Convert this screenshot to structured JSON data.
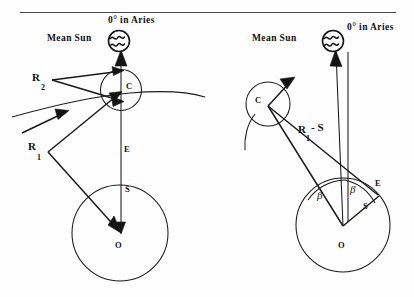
{
  "figure": {
    "title_rule": "horizontal-divider",
    "background_color": "#fefefe",
    "ink_color": "#141414"
  },
  "panels": [
    {
      "id": "left-panel",
      "name": "equation-of-centre-configuration-1",
      "labels": {
        "mean_sun": "Mean Sun",
        "aries": "0° in Aries",
        "deferent_centre": "C",
        "equant_or_earth_point": "E",
        "eccentricity": "S",
        "observer": "O",
        "radius_2": "R",
        "radius_2_sub": "2",
        "radius_1": "R",
        "radius_1_sub": "1"
      },
      "icons": {
        "sun": "sun-aries-glyph"
      }
    },
    {
      "id": "right-panel",
      "name": "equation-of-centre-configuration-2",
      "labels": {
        "mean_sun": "Mean Sun",
        "aries": "0° in Aries",
        "deferent_centre": "C",
        "equant_or_earth_point": "E",
        "eccentricity": "S",
        "observer": "O",
        "radius_expression": "R",
        "radius_expression_sub": "1",
        "radius_expression_tail": "- S",
        "angle_beta_left": "β",
        "angle_beta_right": "β"
      },
      "icons": {
        "sun": "sun-aries-glyph"
      }
    }
  ]
}
